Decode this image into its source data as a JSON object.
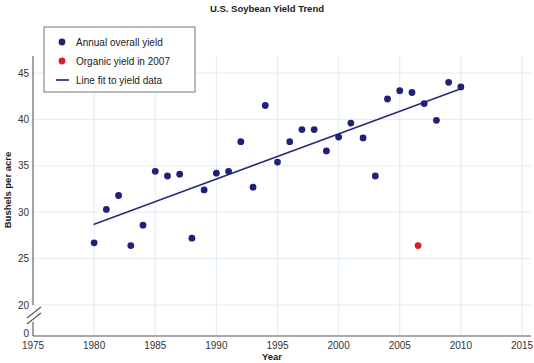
{
  "chart_data": {
    "type": "scatter",
    "title": "U.S. Soybean Yield Trend",
    "xlabel": "Year",
    "ylabel": "Bushels per acre",
    "xlim": [
      1975,
      2015
    ],
    "ylim": [
      18.5,
      47
    ],
    "xticks": [
      1975,
      1980,
      1985,
      1990,
      1995,
      2000,
      2005,
      2010,
      2015
    ],
    "yticks": [
      20,
      25,
      30,
      35,
      40,
      45
    ],
    "y_axis_origin_label": "0",
    "y_axis_broken": true,
    "grid": true,
    "legend_position": "top-left",
    "series": [
      {
        "name": "Annual overall yield",
        "type": "scatter",
        "color": "#1f2278",
        "marker": "circle",
        "points": [
          {
            "x": 1980,
            "y": 26.7
          },
          {
            "x": 1981,
            "y": 30.3
          },
          {
            "x": 1982,
            "y": 31.8
          },
          {
            "x": 1983,
            "y": 26.4
          },
          {
            "x": 1984,
            "y": 28.6
          },
          {
            "x": 1985,
            "y": 34.4
          },
          {
            "x": 1986,
            "y": 33.9
          },
          {
            "x": 1987,
            "y": 34.1
          },
          {
            "x": 1988,
            "y": 27.2
          },
          {
            "x": 1989,
            "y": 32.4
          },
          {
            "x": 1990,
            "y": 34.2
          },
          {
            "x": 1991,
            "y": 34.4
          },
          {
            "x": 1992,
            "y": 37.6
          },
          {
            "x": 1993,
            "y": 32.7
          },
          {
            "x": 1994,
            "y": 41.5
          },
          {
            "x": 1995,
            "y": 35.4
          },
          {
            "x": 1996,
            "y": 37.6
          },
          {
            "x": 1997,
            "y": 38.9
          },
          {
            "x": 1998,
            "y": 38.9
          },
          {
            "x": 1999,
            "y": 36.6
          },
          {
            "x": 2000,
            "y": 38.1
          },
          {
            "x": 2001,
            "y": 39.6
          },
          {
            "x": 2002,
            "y": 38.0
          },
          {
            "x": 2003,
            "y": 33.9
          },
          {
            "x": 2004,
            "y": 42.2
          },
          {
            "x": 2005,
            "y": 43.1
          },
          {
            "x": 2006,
            "y": 42.9
          },
          {
            "x": 2007,
            "y": 41.7
          },
          {
            "x": 2008,
            "y": 39.9
          },
          {
            "x": 2009,
            "y": 44.0
          },
          {
            "x": 2010,
            "y": 43.5
          }
        ]
      },
      {
        "name": "Organic yield in 2007",
        "type": "scatter",
        "color": "#d6202a",
        "marker": "circle",
        "points": [
          {
            "x": 2006.5,
            "y": 26.4
          }
        ]
      },
      {
        "name": "Line fit to yield data",
        "type": "line",
        "color": "#2b2b7a",
        "endpoints": [
          {
            "x": 1980,
            "y": 28.7
          },
          {
            "x": 2010,
            "y": 43.3
          }
        ]
      }
    ]
  },
  "legend": {
    "items": [
      {
        "label": "Annual overall yield",
        "marker": "circle",
        "color": "#1f2278"
      },
      {
        "label": "Organic yield in 2007",
        "marker": "circle",
        "color": "#d6202a"
      },
      {
        "label": "Line fit to yield data",
        "marker": "line",
        "color": "#2b2b7a"
      }
    ]
  }
}
